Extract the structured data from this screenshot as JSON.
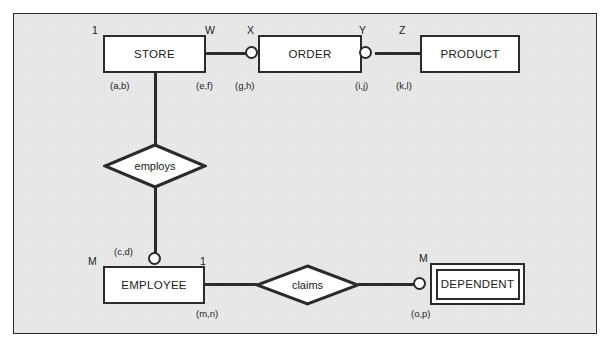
{
  "diagram": {
    "background_color": "#e9e9e9",
    "line_color": "#2b2b2b",
    "entity_fill": "#ffffff",
    "entities": [
      {
        "id": "store",
        "label": "STORE",
        "type": "strong",
        "x": 103,
        "y": 35,
        "w": 103,
        "h": 38
      },
      {
        "id": "order",
        "label": "ORDER",
        "type": "strong",
        "x": 258,
        "y": 35,
        "w": 104,
        "h": 38
      },
      {
        "id": "product",
        "label": "PRODUCT",
        "type": "strong",
        "x": 420,
        "y": 35,
        "w": 100,
        "h": 38
      },
      {
        "id": "employee",
        "label": "EMPLOYEE",
        "type": "strong",
        "x": 103,
        "y": 266,
        "w": 102,
        "h": 38
      },
      {
        "id": "dependent",
        "label": "DEPENDENT",
        "type": "weak",
        "x": 430,
        "y": 263,
        "w": 95,
        "h": 42
      }
    ],
    "relationships": [
      {
        "id": "employs",
        "label": "employs",
        "x": 103,
        "y": 143,
        "w": 104,
        "h": 46
      },
      {
        "id": "claims",
        "label": "claims",
        "x": 255,
        "y": 264,
        "w": 105,
        "h": 42
      }
    ],
    "cardinality_labels": [
      {
        "id": "store-left-card",
        "text": "1",
        "x": 92,
        "y": 24
      },
      {
        "id": "store-right-card",
        "text": "W",
        "x": 205,
        "y": 24
      },
      {
        "id": "order-left-card",
        "text": "X",
        "x": 247,
        "y": 24
      },
      {
        "id": "order-right-card",
        "text": "Y",
        "x": 359,
        "y": 24
      },
      {
        "id": "product-left-card",
        "text": "Z",
        "x": 399,
        "y": 24
      },
      {
        "id": "employee-left-card",
        "text": "M",
        "x": 88,
        "y": 255
      },
      {
        "id": "employee-right-card",
        "text": "1",
        "x": 200,
        "y": 255
      },
      {
        "id": "dependent-left-card",
        "text": "M",
        "x": 419,
        "y": 252
      }
    ],
    "participation_labels": [
      {
        "id": "pair-ab",
        "text": "(a,b)",
        "x": 110,
        "y": 80
      },
      {
        "id": "pair-ef",
        "text": "(e,f)",
        "x": 196,
        "y": 80
      },
      {
        "id": "pair-gh",
        "text": "(g,h)",
        "x": 235,
        "y": 80
      },
      {
        "id": "pair-ij",
        "text": "(i,j)",
        "x": 355,
        "y": 80
      },
      {
        "id": "pair-kl",
        "text": "(k,l)",
        "x": 396,
        "y": 80
      },
      {
        "id": "pair-cd",
        "text": "(c,d)",
        "x": 114,
        "y": 246
      },
      {
        "id": "pair-mn",
        "text": "(m,n)",
        "x": 196,
        "y": 308
      },
      {
        "id": "pair-op",
        "text": "(o,p)",
        "x": 411,
        "y": 308
      }
    ],
    "connectors": [
      {
        "id": "store-to-order",
        "orientation": "h",
        "x": 206,
        "y": 52,
        "length": 45
      },
      {
        "id": "order-to-product",
        "orientation": "h",
        "x": 375,
        "y": 52,
        "length": 46
      },
      {
        "id": "store-to-employs",
        "orientation": "v",
        "x": 154,
        "y": 73,
        "length": 71
      },
      {
        "id": "employs-to-employee",
        "orientation": "v",
        "x": 154,
        "y": 188,
        "length": 66
      },
      {
        "id": "employee-to-claims",
        "orientation": "h",
        "x": 205,
        "y": 284,
        "length": 51
      },
      {
        "id": "claims-to-dependent",
        "orientation": "h",
        "x": 359,
        "y": 284,
        "length": 56
      }
    ],
    "circles": [
      {
        "id": "order-left-circle",
        "x": 245,
        "y": 46
      },
      {
        "id": "order-right-circle",
        "x": 359,
        "y": 46
      },
      {
        "id": "employee-top-circle",
        "x": 148,
        "y": 252
      },
      {
        "id": "dependent-left-circle",
        "x": 414,
        "y": 278
      }
    ]
  }
}
